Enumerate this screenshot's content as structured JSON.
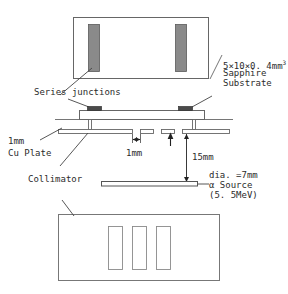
{
  "figure": {
    "stroke_color": "#555555",
    "text_color": "#2b2b2b",
    "junction_fill": "#8a8a8a",
    "pad_fill": "#4a4a4a",
    "background": "#ffffff"
  },
  "labels": {
    "series_junctions": "Series junctions",
    "substrate_dim": "5×10×0. 4mm",
    "substrate_dim_exponent": "3",
    "substrate_name_line1": "Sapphire",
    "substrate_name_line2": "Substrate",
    "cu_plate_thickness": "1mm",
    "cu_plate_name": "Cu Plate",
    "gap_dim": "1mm",
    "collimator": "Collimator",
    "source_distance": "15mm",
    "source_diameter": "dia. =7mm",
    "source_name": "α  Source",
    "source_energy": "(5. 5MeV)"
  },
  "shapes": {
    "top_view": {
      "name": "sapphire-substrate-top-view",
      "outline": {
        "x": 73,
        "y": 17,
        "w": 136,
        "h": 62
      },
      "junction_bars": [
        {
          "x": 88,
          "y": 24,
          "w": 12,
          "h": 48
        },
        {
          "x": 175,
          "y": 24,
          "w": 12,
          "h": 48
        }
      ]
    },
    "cross_section": {
      "name": "assembly-cross-section",
      "substrate_slab": {
        "x": 79,
        "y": 110,
        "w": 126,
        "h": 9
      },
      "junction_pads": [
        {
          "x": 87,
          "y": 106,
          "w": 14,
          "h": 4
        },
        {
          "x": 178,
          "y": 106,
          "w": 14,
          "h": 4
        }
      ],
      "base_line": {
        "x1": 55,
        "y1": 119,
        "x2": 233,
        "y2": 119
      },
      "posts": [
        {
          "x": 88,
          "y": 119,
          "w": 3,
          "h": 11
        },
        {
          "x": 193,
          "y": 119,
          "w": 3,
          "h": 11
        }
      ],
      "cu_segments": [
        {
          "x": 58,
          "y": 129,
          "w": 74,
          "h": 4
        },
        {
          "x": 140,
          "y": 129,
          "w": 13,
          "h": 4
        },
        {
          "x": 161,
          "y": 129,
          "w": 13,
          "h": 4
        },
        {
          "x": 182,
          "y": 129,
          "w": 48,
          "h": 4
        }
      ]
    },
    "alpha_source": {
      "name": "alpha-source-bar",
      "bar": {
        "x": 101,
        "y": 181,
        "w": 97,
        "h": 5
      }
    },
    "collimator_plan": {
      "name": "collimator-plan-view",
      "outline": {
        "x": 58,
        "y": 214,
        "w": 162,
        "h": 67
      },
      "slots": [
        {
          "x": 108,
          "y": 226,
          "w": 15,
          "h": 44
        },
        {
          "x": 132,
          "y": 226,
          "w": 15,
          "h": 44
        },
        {
          "x": 156,
          "y": 226,
          "w": 15,
          "h": 44
        }
      ]
    }
  }
}
